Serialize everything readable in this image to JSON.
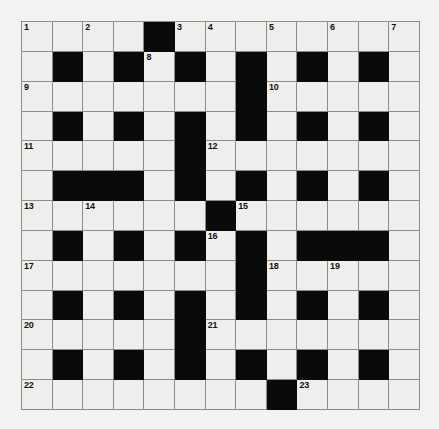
{
  "puzzle": {
    "title": "Crossword Grid",
    "rows": 13,
    "cols": 13,
    "colors": {
      "page_background": "#f2f2f0",
      "empty_cell": "#eeeeec",
      "block_cell": "#0a0a0a",
      "grid_line": "#8c8c8c",
      "number_text": "#111111"
    },
    "grid": [
      [
        "open",
        "open",
        "open",
        "open",
        "block",
        "open",
        "open",
        "open",
        "open",
        "open",
        "open",
        "open",
        "open"
      ],
      [
        "open",
        "block",
        "open",
        "block",
        "open",
        "block",
        "open",
        "block",
        "open",
        "block",
        "open",
        "block",
        "open"
      ],
      [
        "open",
        "open",
        "open",
        "open",
        "open",
        "open",
        "open",
        "block",
        "open",
        "open",
        "open",
        "open",
        "open"
      ],
      [
        "open",
        "block",
        "open",
        "block",
        "open",
        "block",
        "open",
        "block",
        "open",
        "block",
        "open",
        "block",
        "open"
      ],
      [
        "open",
        "open",
        "open",
        "open",
        "open",
        "block",
        "open",
        "open",
        "open",
        "open",
        "open",
        "open",
        "open"
      ],
      [
        "open",
        "block",
        "block",
        "block",
        "open",
        "block",
        "open",
        "block",
        "open",
        "block",
        "open",
        "block",
        "open"
      ],
      [
        "open",
        "open",
        "open",
        "open",
        "open",
        "open",
        "block",
        "open",
        "open",
        "open",
        "open",
        "open",
        "open"
      ],
      [
        "open",
        "block",
        "open",
        "block",
        "open",
        "block",
        "open",
        "block",
        "open",
        "block",
        "block",
        "block",
        "open"
      ],
      [
        "open",
        "open",
        "open",
        "open",
        "open",
        "open",
        "open",
        "block",
        "open",
        "open",
        "open",
        "open",
        "open"
      ],
      [
        "open",
        "block",
        "open",
        "block",
        "open",
        "block",
        "open",
        "block",
        "open",
        "block",
        "open",
        "block",
        "open"
      ],
      [
        "open",
        "open",
        "open",
        "open",
        "open",
        "block",
        "open",
        "open",
        "open",
        "open",
        "open",
        "open",
        "open"
      ],
      [
        "open",
        "block",
        "open",
        "block",
        "open",
        "block",
        "open",
        "block",
        "open",
        "block",
        "open",
        "block",
        "open"
      ],
      [
        "open",
        "open",
        "open",
        "open",
        "open",
        "open",
        "open",
        "open",
        "block",
        "open",
        "open",
        "open",
        "open"
      ]
    ],
    "numbers": [
      {
        "row": 0,
        "col": 0,
        "label": "1"
      },
      {
        "row": 0,
        "col": 2,
        "label": "2"
      },
      {
        "row": 0,
        "col": 5,
        "label": "3"
      },
      {
        "row": 0,
        "col": 6,
        "label": "4"
      },
      {
        "row": 0,
        "col": 8,
        "label": "5"
      },
      {
        "row": 0,
        "col": 10,
        "label": "6"
      },
      {
        "row": 0,
        "col": 12,
        "label": "7"
      },
      {
        "row": 1,
        "col": 4,
        "label": "8"
      },
      {
        "row": 2,
        "col": 0,
        "label": "9"
      },
      {
        "row": 2,
        "col": 8,
        "label": "10"
      },
      {
        "row": 4,
        "col": 0,
        "label": "11"
      },
      {
        "row": 4,
        "col": 6,
        "label": "12"
      },
      {
        "row": 6,
        "col": 0,
        "label": "13"
      },
      {
        "row": 6,
        "col": 2,
        "label": "14"
      },
      {
        "row": 6,
        "col": 7,
        "label": "15"
      },
      {
        "row": 7,
        "col": 6,
        "label": "16"
      },
      {
        "row": 8,
        "col": 0,
        "label": "17"
      },
      {
        "row": 8,
        "col": 8,
        "label": "18"
      },
      {
        "row": 8,
        "col": 10,
        "label": "19"
      },
      {
        "row": 10,
        "col": 0,
        "label": "20"
      },
      {
        "row": 10,
        "col": 6,
        "label": "21"
      },
      {
        "row": 12,
        "col": 0,
        "label": "22"
      },
      {
        "row": 12,
        "col": 9,
        "label": "23"
      }
    ]
  }
}
